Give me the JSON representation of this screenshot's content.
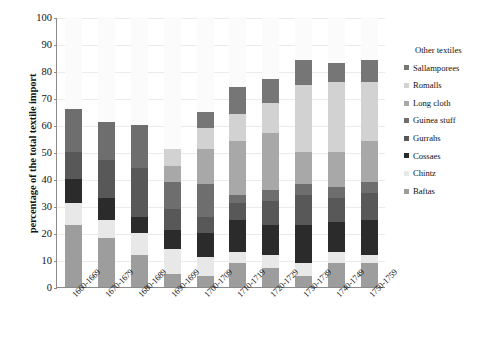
{
  "chart_data": {
    "type": "bar",
    "subtype": "stacked-column",
    "title": "",
    "xlabel": "",
    "ylabel": "percentage of the total textile import",
    "ylim": [
      0,
      100
    ],
    "ytick_step": 10,
    "yticks": [
      "0",
      "10",
      "20",
      "30",
      "40",
      "50",
      "60",
      "70",
      "80",
      "90",
      "100"
    ],
    "grid": true,
    "legend_position": "right",
    "legend_title": "Other textiles",
    "categories": [
      "1660-1669",
      "1670-1679",
      "1680-1689",
      "1690-1699",
      "1700-1709",
      "1710-1719",
      "1720-1729",
      "1730-1739",
      "1740-1749",
      "1750-1759"
    ],
    "series": [
      {
        "name": "Baftas",
        "color": "#9d9d9d",
        "values": [
          23,
          18,
          12,
          5,
          4,
          9,
          7,
          4,
          9,
          9
        ]
      },
      {
        "name": "Chintz",
        "color": "#e8e8e8",
        "values": [
          8,
          7,
          8,
          9,
          7,
          4,
          5,
          5,
          4,
          3
        ]
      },
      {
        "name": "Cossaes",
        "color": "#2b2b2b",
        "values": [
          9,
          8,
          6,
          7,
          9,
          12,
          11,
          14,
          11,
          13
        ]
      },
      {
        "name": "Gurrahs",
        "color": "#585858",
        "values": [
          10,
          14,
          18,
          8,
          6,
          6,
          9,
          11,
          9,
          10
        ]
      },
      {
        "name": "Guinea stuff",
        "color": "#6e6e6e",
        "values": [
          16,
          14,
          16,
          10,
          12,
          3,
          4,
          4,
          4,
          4
        ]
      },
      {
        "name": "Long cloth",
        "color": "#a8a8a8",
        "values": [
          0,
          0,
          0,
          6,
          13,
          20,
          21,
          12,
          13,
          15
        ]
      },
      {
        "name": "Romalls",
        "color": "#d2d2d2",
        "values": [
          0,
          0,
          0,
          6,
          8,
          10,
          11,
          25,
          26,
          22
        ]
      },
      {
        "name": "Sallamporees",
        "color": "#767676",
        "values": [
          0,
          0,
          0,
          0,
          6,
          10,
          9,
          9,
          7,
          8
        ]
      }
    ],
    "totals": [
      66,
      61,
      60,
      51,
      65,
      74,
      77,
      84,
      83,
      84
    ]
  },
  "legend": {
    "title": "Other textiles",
    "items": [
      {
        "label": "Sallamporees",
        "color": "#767676"
      },
      {
        "label": "Romalls",
        "color": "#d2d2d2"
      },
      {
        "label": "Long cloth",
        "color": "#a8a8a8"
      },
      {
        "label": "Guinea stuff",
        "color": "#6e6e6e"
      },
      {
        "label": "Gurrahs",
        "color": "#585858"
      },
      {
        "label": "Cossaes",
        "color": "#2b2b2b"
      },
      {
        "label": "Chintz",
        "color": "#e8e8e8"
      },
      {
        "label": "Baftas",
        "color": "#9d9d9d"
      }
    ]
  },
  "axes": {
    "y_title": "percentage of the total textile import"
  }
}
